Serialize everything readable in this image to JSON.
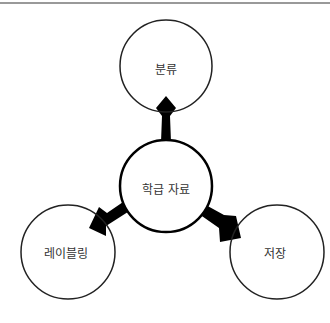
{
  "diagram": {
    "center": {
      "label": "학급 자료"
    },
    "nodes": [
      {
        "id": "top",
        "label": "분류"
      },
      {
        "id": "bottom-left",
        "label": "레이블링"
      },
      {
        "id": "bottom-right",
        "label": "저장"
      }
    ],
    "colors": {
      "stroke": "#222222",
      "arrow": "#000000",
      "rule": "#777777",
      "background": "#ffffff"
    }
  }
}
